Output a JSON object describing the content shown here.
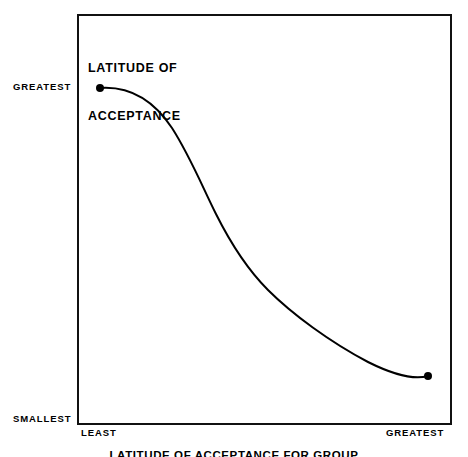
{
  "figure": {
    "title_line_1": "LATITUDE OF",
    "title_line_2": "ACCEPTANCE",
    "caption": "LATITUDE OF ACCEPTANCE FOR GROUP",
    "background_color": "#ffffff",
    "ink_color": "#000000"
  },
  "axes": {
    "y_top_label": "GREATEST",
    "y_bottom_label": "SMALLEST",
    "x_left_label": "LEAST",
    "x_right_label": "GREATEST"
  },
  "chart_data": {
    "type": "line",
    "title": "LATITUDE OF ACCEPTANCE",
    "xlabel": "",
    "ylabel": "LATITUDE OF ACCEPTANCE",
    "grid": false,
    "legend": "none",
    "xlim": [
      0,
      1
    ],
    "ylim": [
      0,
      1
    ],
    "x_tick_labels": [
      "LEAST",
      "GREATEST"
    ],
    "y_tick_labels": [
      "SMALLEST",
      "GREATEST"
    ],
    "annotations": [
      "Endpoint marker at left (LEAST, GREATEST)",
      "Endpoint marker at right (GREATEST, smallest shown)"
    ],
    "series": [
      {
        "name": "Latitude of acceptance",
        "marker_endpoints": true,
        "x": [
          0.06,
          0.13,
          0.2,
          0.27,
          0.33,
          0.37,
          0.41,
          0.45,
          0.5,
          0.55,
          0.6,
          0.66,
          0.72,
          0.79,
          0.86,
          0.94
        ],
        "y": [
          0.82,
          0.8,
          0.76,
          0.69,
          0.6,
          0.54,
          0.47,
          0.41,
          0.34,
          0.29,
          0.25,
          0.21,
          0.18,
          0.15,
          0.13,
          0.115
        ]
      }
    ]
  },
  "curve_geometry": {
    "path": "M 100,88 C 128,86 152,98 172,128 C 190,156 202,186 216,214 C 230,242 246,268 268,290 C 292,314 330,342 368,362 C 392,374 414,380 428,376",
    "stroke_width": 2,
    "start_point": [
      100,
      88
    ],
    "end_point": [
      428,
      376
    ],
    "marker_radius": 4
  }
}
